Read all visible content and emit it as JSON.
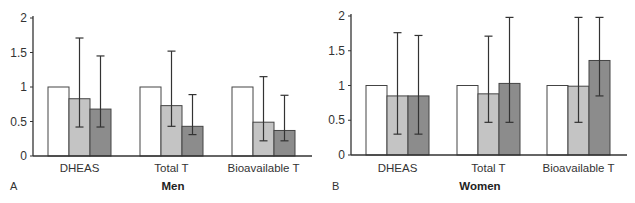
{
  "chart_data": [
    {
      "type": "bar",
      "panel": "A",
      "title": "Men",
      "xlabel": "",
      "ylabel": "",
      "ylim": [
        0,
        2
      ],
      "yticks": [
        "0",
        "0.5",
        "1",
        "1.5",
        "2"
      ],
      "categories": [
        "DHEAS",
        "Total T",
        "Bioavailable T"
      ],
      "legend": "none",
      "grid": false,
      "series": [
        {
          "name": "series-1",
          "color": "#ffffff",
          "values": [
            1.0,
            1.0,
            1.0
          ],
          "err_low": [
            null,
            null,
            null
          ],
          "err_high": [
            null,
            null,
            null
          ]
        },
        {
          "name": "series-2",
          "color": "#c4c4c4",
          "values": [
            0.83,
            0.73,
            0.49
          ],
          "err_low": [
            0.42,
            0.43,
            0.22
          ],
          "err_high": [
            1.71,
            1.52,
            1.15
          ]
        },
        {
          "name": "series-3",
          "color": "#8c8c8c",
          "values": [
            0.68,
            0.43,
            0.37
          ],
          "err_low": [
            0.42,
            0.31,
            0.22
          ],
          "err_high": [
            1.45,
            0.89,
            0.88
          ]
        }
      ]
    },
    {
      "type": "bar",
      "panel": "B",
      "title": "Women",
      "xlabel": "",
      "ylabel": "",
      "ylim": [
        0,
        2
      ],
      "yticks": [
        "0",
        "0.5",
        "1",
        "1.5",
        "2"
      ],
      "categories": [
        "DHEAS",
        "Total T",
        "Bioavailable T"
      ],
      "legend": "none",
      "grid": false,
      "series": [
        {
          "name": "series-1",
          "color": "#ffffff",
          "values": [
            1.0,
            1.0,
            1.0
          ],
          "err_low": [
            null,
            null,
            null
          ],
          "err_high": [
            null,
            null,
            null
          ]
        },
        {
          "name": "series-2",
          "color": "#c4c4c4",
          "values": [
            0.85,
            0.88,
            0.99
          ],
          "err_low": [
            0.3,
            0.47,
            0.47
          ],
          "err_high": [
            1.76,
            1.71,
            1.98
          ]
        },
        {
          "name": "series-3",
          "color": "#8c8c8c",
          "values": [
            0.85,
            1.03,
            1.36
          ],
          "err_low": [
            0.3,
            0.47,
            0.85
          ],
          "err_high": [
            1.72,
            1.98,
            1.98
          ]
        }
      ]
    }
  ]
}
